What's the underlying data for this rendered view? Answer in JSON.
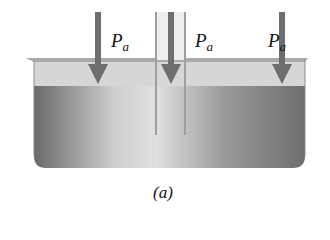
{
  "figure": {
    "caption": "(a)",
    "labels": [
      {
        "symbol": "P",
        "subscript": "a"
      },
      {
        "symbol": "P",
        "subscript": "a"
      },
      {
        "symbol": "P",
        "subscript": "a"
      }
    ],
    "elements": [
      "open container with liquid",
      "vertical tube immersed in liquid",
      "three downward pressure arrows"
    ]
  },
  "colors": {
    "arrow": "#6e6e6e",
    "liquid_dark": "#7a7a7a",
    "liquid_light": "#d8d8d8",
    "air": "#d4d4d4",
    "tube": "#bdbdbd"
  }
}
